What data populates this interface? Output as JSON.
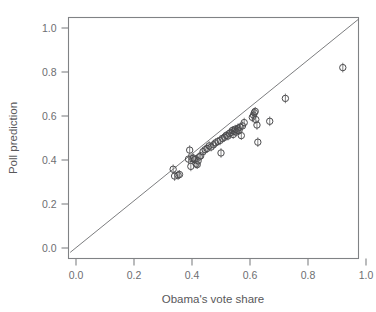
{
  "figure": {
    "background_color": "#ffffff",
    "frame_color": "#808285",
    "point_color": "#4b4b4d",
    "line_color": "#6d6e71"
  },
  "axes": {
    "x_title": "Obama's vote share",
    "y_title": "Poll prediction",
    "x_ticks": [
      "0.0",
      "0.2",
      "0.4",
      "0.6",
      "0.8",
      "1.0"
    ],
    "y_ticks": [
      "0.0",
      "0.2",
      "0.4",
      "0.6",
      "0.8",
      "1.0"
    ]
  },
  "chart_data": {
    "type": "scatter",
    "title": "",
    "subtitle": "",
    "xlabel": "Obama's vote share",
    "ylabel": "Poll prediction",
    "xlim": [
      -0.02,
      1.04
    ],
    "ylim": [
      -0.03,
      1.05
    ],
    "xticks": [
      0.0,
      0.2,
      0.4,
      0.6,
      0.8,
      1.0
    ],
    "yticks": [
      0.0,
      0.2,
      0.4,
      0.6,
      0.8,
      1.0
    ],
    "grid": false,
    "legend": "none",
    "annotations": [
      {
        "type": "reference-line",
        "label": "identity line y = x",
        "x0": -0.02,
        "y0": -0.02,
        "x1": 1.04,
        "y1": 1.04
      }
    ],
    "marker": {
      "shape": "open-circle",
      "radius_px": 3.2,
      "errorbar": "vertical"
    },
    "series": [
      {
        "name": "States",
        "points": [
          {
            "x": 0.335,
            "y": 0.358,
            "yerr": 0.022
          },
          {
            "x": 0.34,
            "y": 0.327,
            "yerr": 0.022
          },
          {
            "x": 0.352,
            "y": 0.331,
            "yerr": 0.022
          },
          {
            "x": 0.357,
            "y": 0.334,
            "yerr": 0.02
          },
          {
            "x": 0.388,
            "y": 0.404,
            "yerr": 0.022
          },
          {
            "x": 0.392,
            "y": 0.445,
            "yerr": 0.022
          },
          {
            "x": 0.396,
            "y": 0.371,
            "yerr": 0.022
          },
          {
            "x": 0.402,
            "y": 0.406,
            "yerr": 0.02
          },
          {
            "x": 0.405,
            "y": 0.409,
            "yerr": 0.02
          },
          {
            "x": 0.41,
            "y": 0.402,
            "yerr": 0.02
          },
          {
            "x": 0.414,
            "y": 0.382,
            "yerr": 0.02
          },
          {
            "x": 0.418,
            "y": 0.379,
            "yerr": 0.02
          },
          {
            "x": 0.421,
            "y": 0.396,
            "yerr": 0.02
          },
          {
            "x": 0.425,
            "y": 0.414,
            "yerr": 0.02
          },
          {
            "x": 0.43,
            "y": 0.419,
            "yerr": 0.02
          },
          {
            "x": 0.438,
            "y": 0.438,
            "yerr": 0.02
          },
          {
            "x": 0.445,
            "y": 0.447,
            "yerr": 0.022
          },
          {
            "x": 0.452,
            "y": 0.452,
            "yerr": 0.02
          },
          {
            "x": 0.459,
            "y": 0.464,
            "yerr": 0.022
          },
          {
            "x": 0.466,
            "y": 0.459,
            "yerr": 0.02
          },
          {
            "x": 0.474,
            "y": 0.469,
            "yerr": 0.02
          },
          {
            "x": 0.481,
            "y": 0.478,
            "yerr": 0.02
          },
          {
            "x": 0.489,
            "y": 0.484,
            "yerr": 0.02
          },
          {
            "x": 0.497,
            "y": 0.489,
            "yerr": 0.022
          },
          {
            "x": 0.5,
            "y": 0.432,
            "yerr": 0.022
          },
          {
            "x": 0.505,
            "y": 0.498,
            "yerr": 0.02
          },
          {
            "x": 0.512,
            "y": 0.503,
            "yerr": 0.02
          },
          {
            "x": 0.518,
            "y": 0.512,
            "yerr": 0.02
          },
          {
            "x": 0.524,
            "y": 0.509,
            "yerr": 0.02
          },
          {
            "x": 0.529,
            "y": 0.521,
            "yerr": 0.02
          },
          {
            "x": 0.534,
            "y": 0.525,
            "yerr": 0.02
          },
          {
            "x": 0.539,
            "y": 0.534,
            "yerr": 0.02
          },
          {
            "x": 0.542,
            "y": 0.516,
            "yerr": 0.02
          },
          {
            "x": 0.546,
            "y": 0.531,
            "yerr": 0.02
          },
          {
            "x": 0.549,
            "y": 0.54,
            "yerr": 0.02
          },
          {
            "x": 0.552,
            "y": 0.527,
            "yerr": 0.02
          },
          {
            "x": 0.556,
            "y": 0.536,
            "yerr": 0.02
          },
          {
            "x": 0.559,
            "y": 0.545,
            "yerr": 0.022
          },
          {
            "x": 0.562,
            "y": 0.533,
            "yerr": 0.02
          },
          {
            "x": 0.566,
            "y": 0.549,
            "yerr": 0.02
          },
          {
            "x": 0.57,
            "y": 0.511,
            "yerr": 0.02
          },
          {
            "x": 0.574,
            "y": 0.555,
            "yerr": 0.02
          },
          {
            "x": 0.58,
            "y": 0.57,
            "yerr": 0.022
          },
          {
            "x": 0.608,
            "y": 0.594,
            "yerr": 0.022
          },
          {
            "x": 0.612,
            "y": 0.604,
            "yerr": 0.022
          },
          {
            "x": 0.615,
            "y": 0.615,
            "yerr": 0.02
          },
          {
            "x": 0.618,
            "y": 0.621,
            "yerr": 0.02
          },
          {
            "x": 0.62,
            "y": 0.584,
            "yerr": 0.02
          },
          {
            "x": 0.624,
            "y": 0.559,
            "yerr": 0.022
          },
          {
            "x": 0.627,
            "y": 0.481,
            "yerr": 0.022
          },
          {
            "x": 0.668,
            "y": 0.576,
            "yerr": 0.022
          },
          {
            "x": 0.722,
            "y": 0.68,
            "yerr": 0.022
          },
          {
            "x": 0.92,
            "y": 0.82,
            "yerr": 0.022
          }
        ]
      }
    ]
  }
}
